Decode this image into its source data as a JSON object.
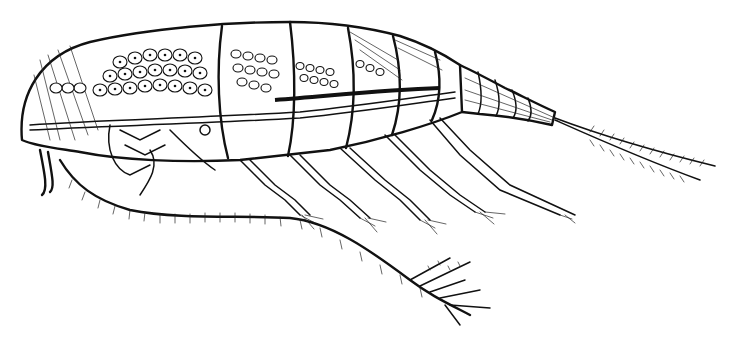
{
  "figure": {
    "style": "black ink line illustration",
    "background": "#ffffff",
    "ink": "#111111",
    "parts": {
      "cephalothorax": "copepod-cephalothorax",
      "urosome": "copepod-urosome",
      "caudal_setae": "caudal-furca-setae",
      "antennule": "first-antenna",
      "swimming_legs": 5
    }
  }
}
